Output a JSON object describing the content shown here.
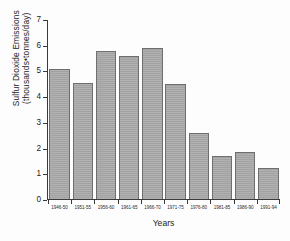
{
  "chart_data": {
    "type": "bar",
    "title": "",
    "xlabel": "Years",
    "ylabel_line1": "Sulfur Dioxide Emissions",
    "ylabel_line2": "(thousands•tonnes/day)",
    "categories": [
      "1946-50",
      "1951-55",
      "1956-60",
      "1961-65",
      "1966-70",
      "1971-75",
      "1976-80",
      "1981-85",
      "1986-90",
      "1991-94"
    ],
    "values": [
      5.1,
      4.55,
      5.8,
      5.6,
      5.9,
      4.5,
      2.6,
      1.7,
      1.85,
      1.2
    ],
    "ylim": [
      0,
      7
    ],
    "yticks": [
      0,
      1,
      2,
      3,
      4,
      5,
      6,
      7
    ],
    "ytick_labels": [
      "0",
      "1",
      "2",
      "3",
      "4",
      "5",
      "6",
      "7"
    ],
    "grid": false,
    "legend": "none",
    "bar_color": "#a9a9a9",
    "bar_edge_color": "#6f6f6f",
    "axis_color": "#3a3a3a",
    "background": "#fdfdfd"
  }
}
